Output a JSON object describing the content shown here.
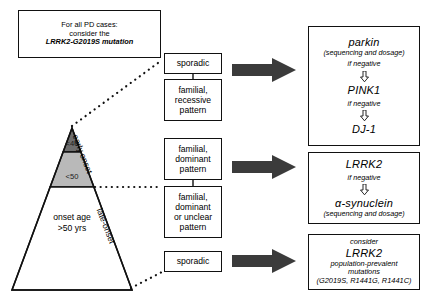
{
  "figure": {
    "type": "clinical-decision-flowchart",
    "background_color": "#ffffff",
    "arrow_color": "#3b3b3b",
    "line_color": "#111111"
  },
  "note_box": {
    "name": "pd-cases-note",
    "lines": [
      {
        "text": "For all PD cases:",
        "italic": false
      },
      {
        "text": "consider the",
        "italic": false
      },
      {
        "text": "LRRK2-G2019S mutation",
        "italic": true
      }
    ]
  },
  "triangle": {
    "apex_label_early": "early onset",
    "apex_label_late": "late-onset",
    "bands": [
      {
        "id": "under40",
        "label": "<40",
        "color": "#6e6e6e"
      },
      {
        "id": "under50",
        "label": "<50",
        "color": "#b9b9b9"
      },
      {
        "id": "over50",
        "label_line1": "onset age",
        "label_line2": ">50 yrs",
        "color": "#ffffff"
      }
    ]
  },
  "middle_boxes": [
    {
      "id": "sporadic-early",
      "lines": [
        "sporadic"
      ]
    },
    {
      "id": "familial-recessive",
      "lines": [
        "familial,",
        "recessive",
        "pattern"
      ]
    },
    {
      "id": "familial-dominant",
      "lines": [
        "familial,",
        "dominant",
        "pattern"
      ]
    },
    {
      "id": "familial-dominant-unclear",
      "lines": [
        "familial,",
        "dominant",
        "or unclear",
        "pattern"
      ]
    },
    {
      "id": "sporadic-late",
      "lines": [
        "sporadic"
      ]
    }
  ],
  "result_boxes": [
    {
      "id": "recessive-panel",
      "steps": [
        {
          "gene": "parkin",
          "sub": "(sequencing and dosage)"
        },
        {
          "cond": "if negative",
          "arrow": "down-arrow-icon"
        },
        {
          "gene": "PINK1",
          "sub": ""
        },
        {
          "cond": "if negative",
          "arrow": "down-arrow-icon"
        },
        {
          "gene": "DJ-1",
          "sub": ""
        }
      ]
    },
    {
      "id": "dominant-panel",
      "steps": [
        {
          "gene": "LRRK2",
          "sub": ""
        },
        {
          "cond": "if negative",
          "arrow": "down-arrow-icon"
        },
        {
          "gene": "α-synuclein",
          "sub": "(sequencing and dosage)"
        }
      ]
    },
    {
      "id": "late-onset-panel",
      "lines": [
        {
          "text": "consider",
          "style": "small-it"
        },
        {
          "text": "LRRK2",
          "style": "gene"
        },
        {
          "text": "population-prevalent",
          "style": "small-it"
        },
        {
          "text": "mutations",
          "style": "small-it"
        },
        {
          "text": "(G2019S, R1441G, R1441C)",
          "style": "small-it"
        }
      ]
    }
  ],
  "arrows": [
    {
      "id": "arrow-to-recessive-panel",
      "name": "right-arrow-icon"
    },
    {
      "id": "arrow-to-dominant-panel",
      "name": "right-arrow-icon"
    },
    {
      "id": "arrow-to-late-onset-panel",
      "name": "right-arrow-icon"
    }
  ]
}
